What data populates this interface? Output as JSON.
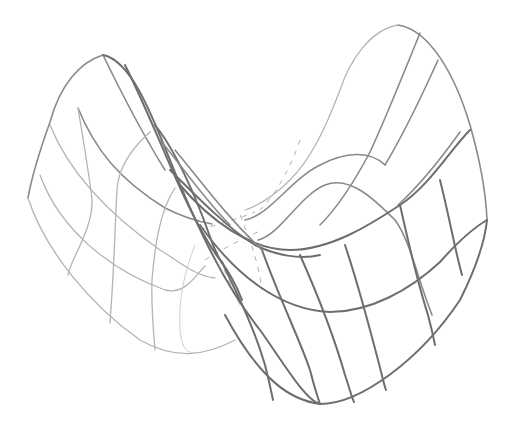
{
  "figure": {
    "background_color": "#ffffff",
    "line_color_front": "#6e6e6e",
    "line_color_back": "#b4b4b4",
    "grid": {
      "u_lines": 6,
      "v_lines": 6
    }
  }
}
